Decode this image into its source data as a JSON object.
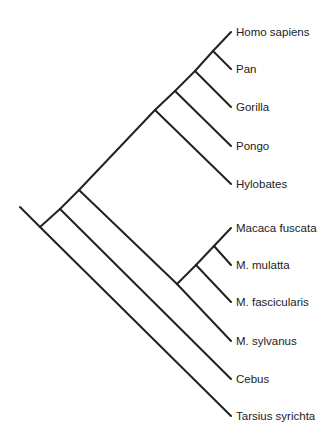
{
  "diagram": {
    "type": "phylogenetic-tree",
    "orientation": "slanted-cladogram",
    "line_color": "#222222",
    "taxa": [
      {
        "id": "homo",
        "label": "Homo sapiens",
        "x": 231,
        "y": 32
      },
      {
        "id": "pan",
        "label": "Pan",
        "x": 231,
        "y": 69
      },
      {
        "id": "gorilla",
        "label": "Gorilla",
        "x": 231,
        "y": 107
      },
      {
        "id": "pongo",
        "label": "Pongo",
        "x": 231,
        "y": 146
      },
      {
        "id": "hylobates",
        "label": "Hylobates",
        "x": 231,
        "y": 184
      },
      {
        "id": "fuscata",
        "label": "Macaca fuscata",
        "x": 231,
        "y": 228
      },
      {
        "id": "mulatta",
        "label": "M. mulatta",
        "x": 231,
        "y": 265
      },
      {
        "id": "fascicularis",
        "label": "M. fascicularis",
        "x": 231,
        "y": 302
      },
      {
        "id": "sylvanus",
        "label": "M. sylvanus",
        "x": 231,
        "y": 341
      },
      {
        "id": "cebus",
        "label": "Cebus",
        "x": 231,
        "y": 379
      },
      {
        "id": "tarsius",
        "label": "Tarsius syrichta",
        "x": 231,
        "y": 416
      }
    ],
    "nodes": [
      {
        "id": "root",
        "x": 40,
        "y": 227,
        "stem": {
          "x": 20,
          "y": 207
        }
      },
      {
        "id": "anthropoidea",
        "x": 60,
        "y": 209
      },
      {
        "id": "catarrhini",
        "x": 79,
        "y": 190
      },
      {
        "id": "hominoidea",
        "x": 155,
        "y": 110
      },
      {
        "id": "hominidae",
        "x": 175,
        "y": 91
      },
      {
        "id": "homininae",
        "x": 195,
        "y": 71
      },
      {
        "id": "homo_pan",
        "x": 213,
        "y": 51
      },
      {
        "id": "macaca",
        "x": 177,
        "y": 284
      },
      {
        "id": "macaca_asian",
        "x": 196,
        "y": 265
      },
      {
        "id": "fuscata_mulatta",
        "x": 214,
        "y": 246
      }
    ],
    "edges": [
      [
        "root",
        "anthropoidea"
      ],
      [
        "root",
        "tarsius"
      ],
      [
        "anthropoidea",
        "catarrhini"
      ],
      [
        "anthropoidea",
        "cebus"
      ],
      [
        "catarrhini",
        "hominoidea"
      ],
      [
        "catarrhini",
        "macaca"
      ],
      [
        "hominoidea",
        "hominidae"
      ],
      [
        "hominoidea",
        "hylobates"
      ],
      [
        "hominidae",
        "homininae"
      ],
      [
        "hominidae",
        "pongo"
      ],
      [
        "homininae",
        "homo_pan"
      ],
      [
        "homininae",
        "gorilla"
      ],
      [
        "homo_pan",
        "homo"
      ],
      [
        "homo_pan",
        "pan"
      ],
      [
        "macaca",
        "macaca_asian"
      ],
      [
        "macaca",
        "sylvanus"
      ],
      [
        "macaca_asian",
        "fuscata_mulatta"
      ],
      [
        "macaca_asian",
        "fascicularis"
      ],
      [
        "fuscata_mulatta",
        "fuscata"
      ],
      [
        "fuscata_mulatta",
        "mulatta"
      ]
    ],
    "labels": {
      "homo": "Homo sapiens",
      "pan": "Pan",
      "gorilla": "Gorilla",
      "pongo": "Pongo",
      "hylobates": "Hylobates",
      "fuscata": "Macaca fuscata",
      "mulatta": "M. mulatta",
      "fascicularis": "M. fascicularis",
      "sylvanus": "M. sylvanus",
      "cebus": "Cebus",
      "tarsius": "Tarsius syrichta"
    }
  }
}
